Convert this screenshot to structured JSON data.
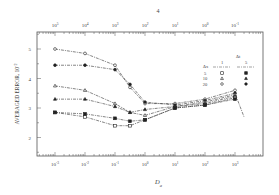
{
  "page_marker": "4",
  "chart_data": {
    "type": "line",
    "title": "",
    "xlabel": "D_a",
    "ylabel": "AVERAGED ERROR, 10^-2",
    "xscale": "log",
    "x_ticks": [
      "10^-3",
      "10^-2",
      "10^-1",
      "10^0",
      "10^1",
      "10^2",
      "10^3"
    ],
    "top_axis_ticks": [
      "10^5",
      "10^4",
      "10^3",
      "10^2",
      "10^1",
      "10^0",
      "10^-1"
    ],
    "y_ticks": [
      2,
      3,
      4,
      5
    ],
    "ylim": [
      1.4,
      5.6
    ],
    "xlim_log10": [
      -3.6,
      4.0
    ],
    "grid": false,
    "legend": {
      "position": "upper right",
      "header": "Δt",
      "row_header": "Δx",
      "columns": [
        "1",
        "5"
      ],
      "rows": [
        {
          "dx": "5",
          "open": "square",
          "filled": "square"
        },
        {
          "dx": "10",
          "open": "triangle",
          "filled": "triangle"
        },
        {
          "dx": "20",
          "open": "circle",
          "filled": "circle"
        }
      ]
    },
    "x_log10": [
      -3,
      -2,
      -1,
      -0.5,
      0,
      1,
      2,
      3,
      3.3
    ],
    "series": [
      {
        "name": "Δx=20, Δt=1",
        "marker": "circle",
        "filled": false,
        "values": [
          5.0,
          4.85,
          4.45,
          3.7,
          3.15,
          3.15,
          3.3,
          3.6,
          null
        ]
      },
      {
        "name": "Δx=20, Δt=5",
        "marker": "circle",
        "filled": true,
        "values": [
          4.45,
          4.45,
          4.3,
          3.8,
          3.2,
          3.1,
          3.25,
          3.5,
          2.7
        ]
      },
      {
        "name": "Δx=10, Δt=1",
        "marker": "triangle",
        "filled": false,
        "values": [
          3.75,
          3.6,
          3.15,
          2.85,
          2.75,
          3.05,
          3.2,
          3.45,
          null
        ]
      },
      {
        "name": "Δx=10, Δt=5",
        "marker": "triangle",
        "filled": true,
        "values": [
          3.3,
          3.3,
          3.05,
          2.85,
          2.95,
          3.05,
          3.15,
          3.4,
          null
        ]
      },
      {
        "name": "Δx=5, Δt=1",
        "marker": "square",
        "filled": false,
        "values": [
          2.85,
          2.7,
          2.4,
          2.4,
          2.6,
          3.0,
          3.1,
          3.35,
          null
        ]
      },
      {
        "name": "Δx=5, Δt=5",
        "marker": "square",
        "filled": true,
        "values": [
          2.85,
          2.8,
          2.65,
          2.55,
          2.6,
          3.0,
          3.1,
          3.3,
          null
        ]
      }
    ]
  }
}
